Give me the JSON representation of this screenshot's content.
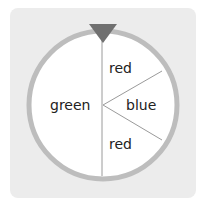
{
  "spinner": {
    "sections": [
      {
        "label": "green",
        "position": "left half"
      },
      {
        "label": "red",
        "position": "upper right"
      },
      {
        "label": "blue",
        "position": "right wedge"
      },
      {
        "label": "red",
        "position": "lower right"
      }
    ],
    "pointer_color": "#707070",
    "ring_color": "#bdbdbd",
    "background_color": "#ececec"
  }
}
